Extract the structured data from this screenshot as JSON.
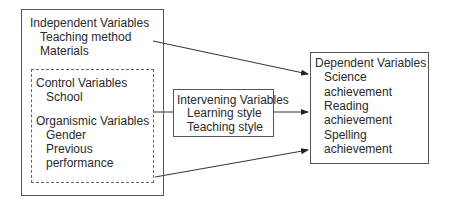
{
  "independent": {
    "title": "Independent Variables",
    "items": [
      "Teaching method",
      "Materials"
    ]
  },
  "control": {
    "title": "Control Variables",
    "items": [
      "School"
    ]
  },
  "organismic": {
    "title": "Organismic Variables",
    "items": [
      "Gender",
      "Previous",
      "performance"
    ]
  },
  "intervening": {
    "title": "Intervening Variables",
    "items": [
      "Learning style",
      "Teaching style"
    ]
  },
  "dependent": {
    "title": "Dependent Variables",
    "items": [
      "Science",
      "achievement",
      "Reading",
      "achievement",
      "Spelling",
      "achievement"
    ]
  }
}
